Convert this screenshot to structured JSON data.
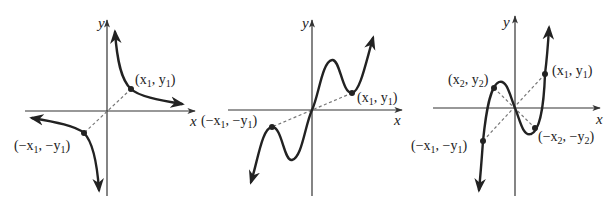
{
  "figure": {
    "panels": [
      {
        "id": "panel-1",
        "curve_type": "hyperbola-like (y = k/x)",
        "axes": {
          "x_label": "x",
          "y_label": "y"
        },
        "points": [
          {
            "label": "(x1, y1)",
            "text_main": "(x",
            "sub1": "1",
            "mid": ", y",
            "sub2": "1",
            "end": ")"
          },
          {
            "label": "(-x1, -y1)",
            "text_main": "(−x",
            "sub1": "1",
            "mid": ", −y",
            "sub2": "1",
            "end": ")"
          }
        ]
      },
      {
        "id": "panel-2",
        "curve_type": "odd wavy curve through origin",
        "axes": {
          "x_label": "x",
          "y_label": "y"
        },
        "points": [
          {
            "label": "(x1, y1)",
            "text_main": "(x",
            "sub1": "1",
            "mid": ", y",
            "sub2": "1",
            "end": ")"
          },
          {
            "label": "(-x1, -y1)",
            "text_main": "(−x",
            "sub1": "1",
            "mid": ", −y",
            "sub2": "1",
            "end": ")"
          }
        ]
      },
      {
        "id": "panel-3",
        "curve_type": "cubic through origin",
        "axes": {
          "x_label": "x",
          "y_label": "y"
        },
        "points": [
          {
            "label": "(x1, y1)",
            "text_main": "(x",
            "sub1": "1",
            "mid": ", y",
            "sub2": "1",
            "end": ")"
          },
          {
            "label": "(x2, y2)",
            "text_main": "(x",
            "sub1": "2",
            "mid": ", y",
            "sub2": "2",
            "end": ")"
          },
          {
            "label": "(-x2, -y2)",
            "text_main": "(−x",
            "sub1": "2",
            "mid": ", −y",
            "sub2": "2",
            "end": ")"
          },
          {
            "label": "(-x1, -y1)",
            "text_main": "(−x",
            "sub1": "1",
            "mid": ", −y",
            "sub2": "1",
            "end": ")"
          }
        ]
      }
    ]
  }
}
